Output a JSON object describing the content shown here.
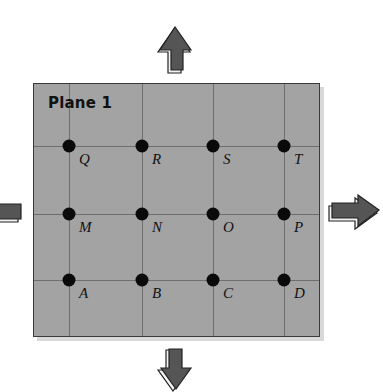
{
  "plane": {
    "title": "Plane 1",
    "fill_color": "#a3a3a3",
    "grid_color": "#6e6e6e"
  },
  "points": [
    {
      "label": "Q",
      "row": 0,
      "col": 0
    },
    {
      "label": "R",
      "row": 0,
      "col": 1
    },
    {
      "label": "S",
      "row": 0,
      "col": 2
    },
    {
      "label": "T",
      "row": 0,
      "col": 3
    },
    {
      "label": "M",
      "row": 1,
      "col": 0
    },
    {
      "label": "N",
      "row": 1,
      "col": 1
    },
    {
      "label": "O",
      "row": 1,
      "col": 2
    },
    {
      "label": "P",
      "row": 1,
      "col": 3
    },
    {
      "label": "A",
      "row": 2,
      "col": 0
    },
    {
      "label": "B",
      "row": 2,
      "col": 1
    },
    {
      "label": "C",
      "row": 2,
      "col": 2
    },
    {
      "label": "D",
      "row": 2,
      "col": 3
    }
  ],
  "arrows": [
    {
      "direction": "up"
    },
    {
      "direction": "down"
    },
    {
      "direction": "left"
    },
    {
      "direction": "right"
    }
  ],
  "arrow_color": "#555555"
}
